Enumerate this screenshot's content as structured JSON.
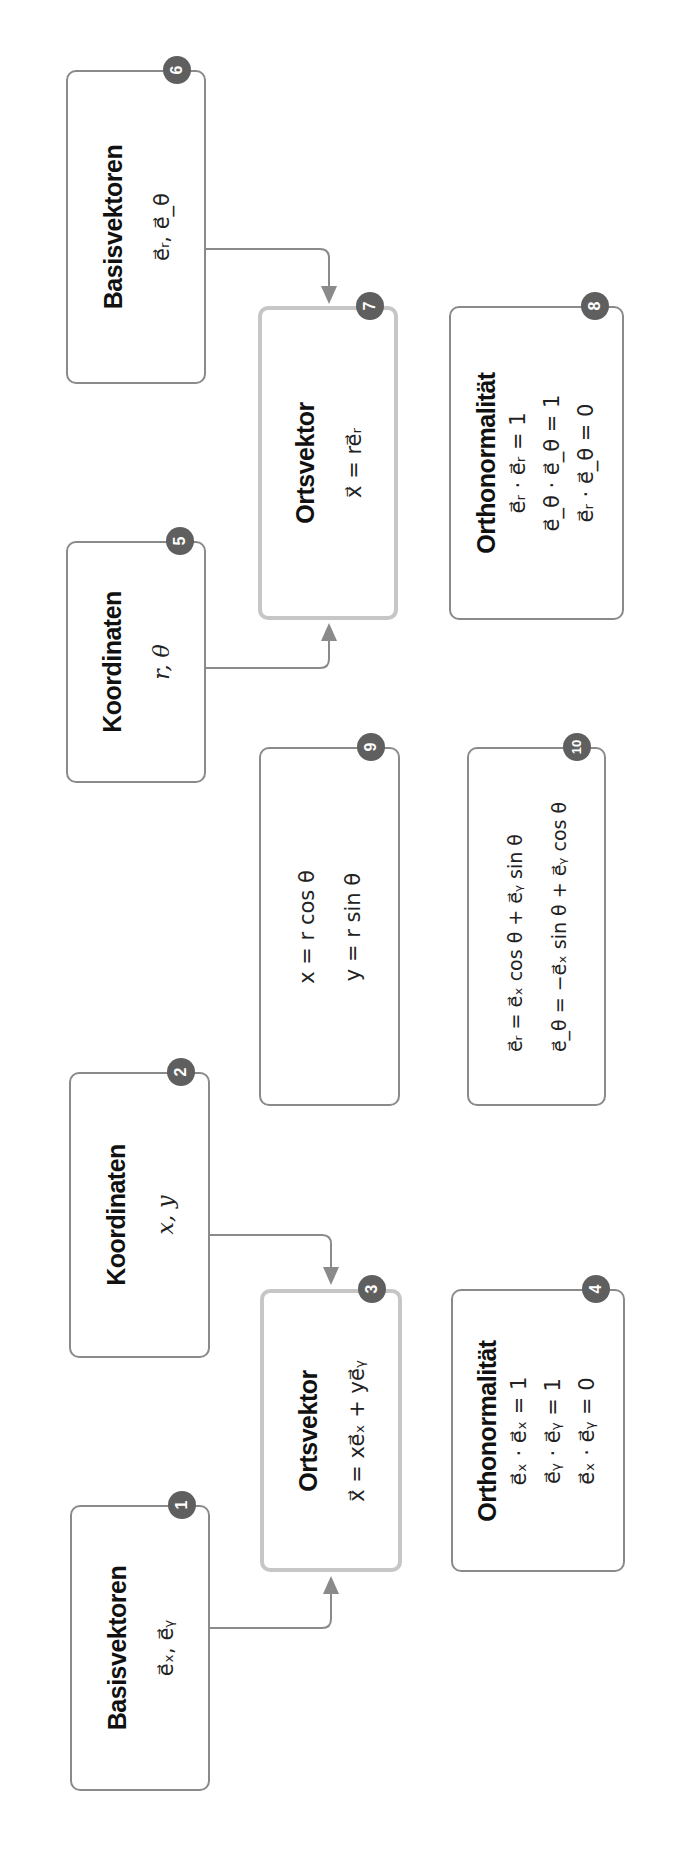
{
  "colors": {
    "border": "#8a8a8a",
    "highlight_border": "#c6c6c6",
    "badge": "#5f5f5f",
    "arrow": "#8a8a8a"
  },
  "boxes": [
    {
      "id": 1,
      "badge": "1",
      "title": "Basisvektoren",
      "lines": [
        "e⃗ₓ, e⃗ᵧ"
      ]
    },
    {
      "id": 2,
      "badge": "2",
      "title": "Koordinaten",
      "lines": [
        "x,  y"
      ]
    },
    {
      "id": 3,
      "badge": "3",
      "title": "Ortsvektor",
      "lines": [
        "x⃗ = xe⃗ₓ + ye⃗ᵧ"
      ]
    },
    {
      "id": 4,
      "badge": "4",
      "title": "Orthonormalität",
      "lines": [
        "e⃗ₓ · e⃗ₓ = 1",
        "e⃗ᵧ · e⃗ᵧ = 1",
        "e⃗ₓ · e⃗ᵧ = 0"
      ]
    },
    {
      "id": 5,
      "badge": "5",
      "title": "Koordinaten",
      "lines": [
        "r,  θ"
      ]
    },
    {
      "id": 6,
      "badge": "6",
      "title": "Basisvektoren",
      "lines": [
        "e⃗ᵣ, e⃗_θ"
      ]
    },
    {
      "id": 7,
      "badge": "7",
      "title": "Ortsvektor",
      "lines": [
        "x⃗ = re⃗ᵣ"
      ]
    },
    {
      "id": 8,
      "badge": "8",
      "title": "Orthonormalität",
      "lines": [
        "e⃗ᵣ · e⃗ᵣ = 1",
        "e⃗_θ · e⃗_θ = 1",
        "e⃗ᵣ · e⃗_θ = 0"
      ]
    },
    {
      "id": 9,
      "badge": "9",
      "title": "",
      "lines": [
        "x = r cos θ",
        "y = r sin θ"
      ]
    },
    {
      "id": 10,
      "badge": "10",
      "title": "",
      "lines": [
        "e⃗ᵣ = e⃗ₓ cos θ + e⃗ᵧ sin θ",
        "e⃗_θ = −e⃗ₓ sin θ + e⃗ᵧ cos θ"
      ]
    }
  ],
  "arrows": [
    {
      "from": 1,
      "to": 3
    },
    {
      "from": 2,
      "to": 3
    },
    {
      "from": 5,
      "to": 7
    },
    {
      "from": 6,
      "to": 7
    }
  ]
}
